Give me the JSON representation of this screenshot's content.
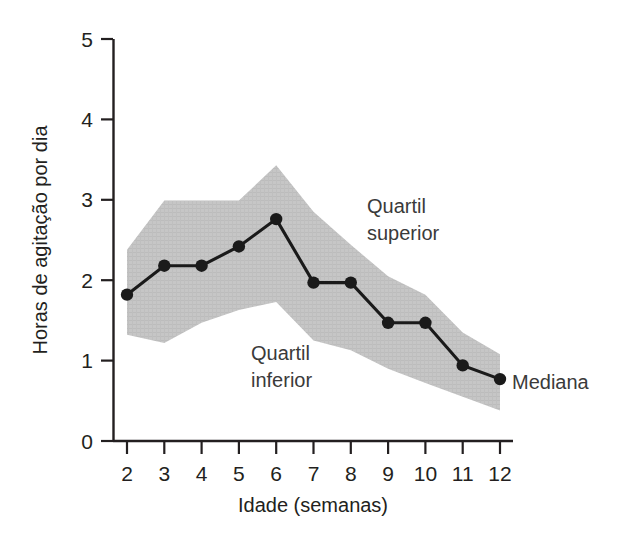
{
  "chart_data": {
    "type": "line",
    "title": "",
    "xlabel": "Idade (semanas)",
    "ylabel": "Horas de agitação por dia",
    "xlim": [
      2,
      12
    ],
    "ylim": [
      0,
      5
    ],
    "grid": false,
    "legend_position": "inline-annotations",
    "x": [
      2,
      3,
      4,
      5,
      6,
      7,
      8,
      9,
      10,
      11,
      12
    ],
    "xtick_labels": [
      "2",
      "3",
      "4",
      "5",
      "6",
      "7",
      "8",
      "9",
      "10",
      "11",
      "12"
    ],
    "ytick_labels": [
      "0",
      "1",
      "2",
      "3",
      "4",
      "5"
    ],
    "yticks": [
      0,
      1,
      2,
      3,
      4,
      5
    ],
    "series": [
      {
        "name": "Mediana",
        "type": "line-markers",
        "color": "#1a1a1a",
        "values": [
          1.82,
          2.18,
          2.18,
          2.42,
          2.76,
          1.97,
          1.97,
          1.47,
          1.47,
          0.94,
          0.77
        ]
      },
      {
        "name": "Quartil superior",
        "type": "band-upper",
        "color": "#c6c6c6",
        "values": [
          2.38,
          2.99,
          2.99,
          2.99,
          3.43,
          2.85,
          2.44,
          2.05,
          1.82,
          1.35,
          1.08
        ]
      },
      {
        "name": "Quartil inferior",
        "type": "band-lower",
        "color": "#c6c6c6",
        "values": [
          1.32,
          1.22,
          1.47,
          1.63,
          1.73,
          1.25,
          1.13,
          0.9,
          0.72,
          0.55,
          0.38
        ]
      }
    ],
    "annotations": [
      {
        "id": "quartil-superior",
        "line1": "Quartil",
        "line2": "superior",
        "x": 8.05,
        "y": 3.02
      },
      {
        "id": "quartil-inferior",
        "line1": "Quartil",
        "line2": "inferior",
        "x": 5.1,
        "y": 1.18
      },
      {
        "id": "mediana",
        "line1": "Mediana",
        "line2": "",
        "x": 12.35,
        "y": 0.77
      }
    ]
  },
  "axes": {
    "x_title": "Idade (semanas)",
    "y_title": "Horas de agitação por dia"
  },
  "colors": {
    "band_fill": "#c6c6c6",
    "line": "#1a1a1a",
    "axis": "#231f20",
    "text": "#231f20",
    "annotation_text": "#3a3a3a",
    "background": "#ffffff"
  }
}
